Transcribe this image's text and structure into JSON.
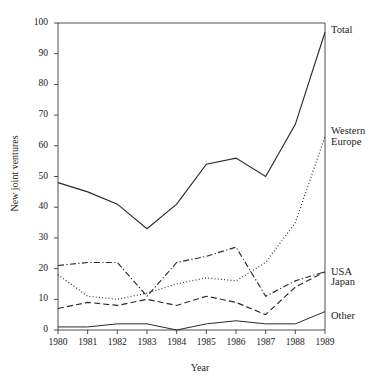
{
  "chart_data": {
    "type": "line",
    "title": "",
    "xlabel": "Year",
    "ylabel": "New joint ventures",
    "x": [
      1980,
      1981,
      1982,
      1983,
      1984,
      1985,
      1986,
      1987,
      1988,
      1989
    ],
    "categories": [
      "1980",
      "1981",
      "1982",
      "1983",
      "1984",
      "1985",
      "1986",
      "1987",
      "1988",
      "1989"
    ],
    "xlim": [
      1980,
      1989
    ],
    "ylim": [
      0,
      100
    ],
    "yticks": [
      0,
      10,
      20,
      30,
      40,
      50,
      60,
      70,
      80,
      90,
      100
    ],
    "ytick_labels": [
      "0",
      "10",
      "20",
      "30",
      "40",
      "50",
      "60",
      "70",
      "80",
      "90",
      "100"
    ],
    "grid": false,
    "legend_position": "right-inline",
    "series": [
      {
        "name": "Total",
        "label": "Total",
        "style": "solid",
        "values": [
          48,
          45,
          41,
          33,
          41,
          54,
          56,
          50,
          67,
          97
        ]
      },
      {
        "name": "Western Europe",
        "label": "Western\nEurope",
        "style": "dotted",
        "values": [
          18,
          11,
          10,
          12,
          15,
          17,
          16,
          22,
          35,
          63
        ]
      },
      {
        "name": "USA",
        "label": "USA",
        "style": "dashdot",
        "values": [
          21,
          22,
          22,
          11,
          22,
          24,
          27,
          11,
          16,
          19
        ]
      },
      {
        "name": "Japan",
        "label": "Japan",
        "style": "dashed",
        "values": [
          7,
          9,
          8,
          10,
          8,
          11,
          9,
          5,
          14,
          19
        ]
      },
      {
        "name": "Other",
        "label": "Other",
        "style": "solid-thin",
        "values": [
          1,
          1,
          2,
          2,
          0,
          2,
          3,
          2,
          2,
          6
        ]
      }
    ]
  },
  "axes": {
    "y_title": "New joint ventures",
    "x_title": "Year"
  }
}
